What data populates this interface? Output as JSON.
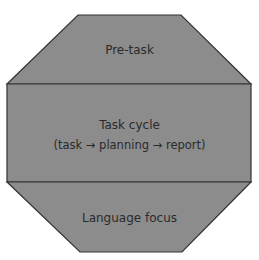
{
  "diagram": {
    "type": "octagon-framework",
    "colors": {
      "fill": "#8c8c8c",
      "stroke": "#333333",
      "text": "#2a2a2a",
      "background": "#ffffff"
    },
    "sections": [
      {
        "id": "pre-task",
        "label": "Pre-task"
      },
      {
        "id": "task-cycle",
        "label": "Task cycle",
        "sublabel": "(task → planning → report)"
      },
      {
        "id": "language-focus",
        "label": "Language focus"
      }
    ]
  }
}
